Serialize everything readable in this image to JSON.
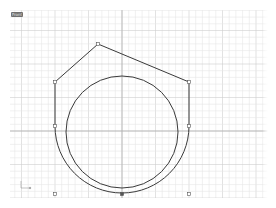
{
  "viewport": {
    "label": "Front",
    "background": "#ffffff",
    "grid": {
      "minor_color": "#e6e6e6",
      "major_color": "#cfcfcf",
      "axis_color": "#b4b4b4",
      "minor_spacing_px": 6.7,
      "major_every": 5
    },
    "geometry": {
      "curve_color": "#3a3a3a",
      "polyline_points": [
        [
          55,
          82
        ],
        [
          98,
          44
        ],
        [
          189,
          82
        ]
      ],
      "left_line": [
        [
          55,
          82
        ],
        [
          55,
          126
        ]
      ],
      "right_line": [
        [
          189,
          82
        ],
        [
          189,
          126
        ]
      ],
      "outer_arc": {
        "center": [
          122,
          126
        ],
        "radius": 67
      },
      "inner_circle": {
        "center": [
          122,
          132
        ],
        "radius": 56
      },
      "control_points": [
        [
          55,
          82
        ],
        [
          98,
          44
        ],
        [
          189,
          82
        ],
        [
          55,
          126
        ],
        [
          189,
          126
        ],
        [
          55,
          194
        ],
        [
          122,
          194
        ],
        [
          189,
          194
        ]
      ]
    },
    "axis_icon": {
      "x_label": "x",
      "y_label": "y"
    }
  }
}
